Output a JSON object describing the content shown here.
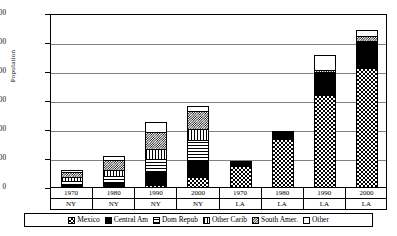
{
  "chart_data": {
    "type": "bar",
    "subtype": "stacked-bar",
    "title": "",
    "xlabel": "",
    "ylabel": "Population",
    "ylim": [
      0,
      3000000
    ],
    "ytick_labels": [
      "3,000,000",
      "2,500,000",
      "2,000,000",
      "1,500,000",
      "1,000,000",
      "500,000",
      "0"
    ],
    "ytick_values": [
      3000000,
      2500000,
      2000000,
      1500000,
      1000000,
      500000,
      0
    ],
    "ytick_step": 500000,
    "grid": true,
    "grid_axis": "y",
    "legend_position": "bottom",
    "categories": [
      "1970",
      "1980",
      "1990",
      "2000",
      "1970",
      "1980",
      "1990",
      "2000"
    ],
    "group_labels": [
      "NY",
      "NY",
      "NY",
      "NY",
      "LA",
      "LA",
      "LA",
      "LA"
    ],
    "series": [
      {
        "name": "Mexico",
        "pattern": "p-mexico",
        "values": [
          12000,
          25000,
          60000,
          190000,
          380000,
          850000,
          1610000,
          2070000
        ]
      },
      {
        "name": "Central Am",
        "pattern": "p-central",
        "values": [
          22000,
          70000,
          230000,
          300000,
          18000,
          75000,
          370000,
          450000
        ]
      },
      {
        "name": "Dom Repub",
        "pattern": "p-domrep",
        "values": [
          78000,
          140000,
          250000,
          370000,
          3000,
          8000,
          15000,
          22000
        ]
      },
      {
        "name": "Other Carib",
        "pattern": "p-carib",
        "values": [
          95000,
          125000,
          180000,
          205000,
          4000,
          10000,
          20000,
          30000
        ]
      },
      {
        "name": "South Amer.",
        "pattern": "p-south",
        "values": [
          100000,
          175000,
          310000,
          340000,
          8000,
          25000,
          55000,
          95000
        ]
      },
      {
        "name": "Other",
        "pattern": "p-other",
        "values": [
          63000,
          95000,
          190000,
          95000,
          7000,
          32000,
          280000,
          133000
        ]
      }
    ],
    "totals": [
      370000,
      630000,
      1220000,
      1500000,
      420000,
      1000000,
      2350000,
      2800000
    ]
  },
  "legend": {
    "items": [
      {
        "label": "Mexico"
      },
      {
        "label": "Central Am"
      },
      {
        "label": "Dom Repub"
      },
      {
        "label": "Other Carib"
      },
      {
        "label": "South Amer."
      },
      {
        "label": "Other"
      }
    ]
  }
}
